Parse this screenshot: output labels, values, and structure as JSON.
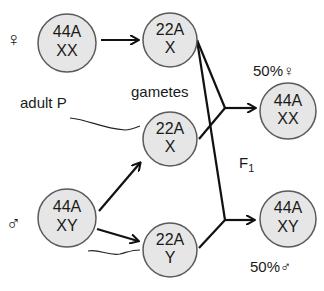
{
  "parents": {
    "female": {
      "symbol": "♀",
      "line1": "44A",
      "line2": "XX"
    },
    "male": {
      "symbol": "♂",
      "line1": "44A",
      "line2": "XY"
    },
    "label": "adult P"
  },
  "gametes": {
    "label": "gametes",
    "egg": {
      "line1": "22A",
      "line2": "X"
    },
    "sperm_x": {
      "line1": "22A",
      "line2": "X"
    },
    "sperm_y": {
      "line1": "22A",
      "line2": "Y"
    }
  },
  "offspring": {
    "label": "F",
    "label_sub": "1",
    "female": {
      "line1": "44A",
      "line2": "XX",
      "percent": "50%",
      "symbol": "♀"
    },
    "male": {
      "line1": "44A",
      "line2": "XY",
      "percent": "50%",
      "symbol": "♂"
    }
  },
  "colors": {
    "cell_fill": "#e6e6e6",
    "cell_stroke": "#5a5a5a",
    "line": "#111111"
  }
}
